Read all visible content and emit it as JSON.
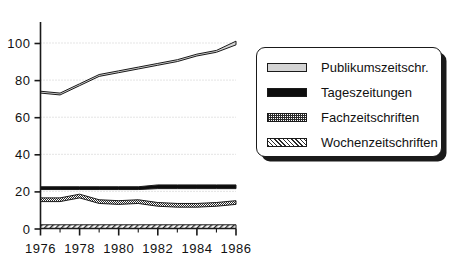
{
  "chart_data": {
    "type": "area",
    "title": "",
    "subtitle": "",
    "xlabel": "",
    "ylabel": "",
    "xlim": [
      1976,
      1986
    ],
    "ylim": [
      0,
      105
    ],
    "grid": true,
    "legend_position": "right",
    "x": [
      1976,
      1977,
      1978,
      1979,
      1980,
      1981,
      1982,
      1983,
      1984,
      1985,
      1986
    ],
    "xtick_labels": [
      "1976",
      "1978",
      "1980",
      "1982",
      "1984",
      "1986"
    ],
    "xtick_values": [
      1976,
      1978,
      1980,
      1982,
      1984,
      1986
    ],
    "ytick_labels": [
      "0",
      "20",
      "40",
      "60",
      "80",
      "100"
    ],
    "ytick_values": [
      0,
      20,
      40,
      60,
      80,
      100
    ],
    "series": [
      {
        "name": "Publikumszeitschr.",
        "pattern": "light-gray-band",
        "color": "#d4d4d4",
        "values": [
          74,
          73,
          78,
          83,
          85,
          87,
          89,
          91,
          94,
          96,
          101
        ],
        "values_lower": [
          73,
          72,
          77,
          82,
          84,
          86,
          88,
          90,
          93,
          95,
          99
        ]
      },
      {
        "name": "Tageszeitungen",
        "pattern": "solid-black-band",
        "color": "#0d0d0d",
        "values": [
          22.5,
          22.5,
          22.5,
          22.5,
          22.5,
          22.5,
          23.5,
          23.5,
          23.5,
          23.5,
          23.5
        ],
        "values_lower": [
          21,
          21,
          21,
          21,
          21,
          21,
          21.5,
          21.5,
          21.5,
          21.5,
          21.5
        ]
      },
      {
        "name": "Fachzeitschriften",
        "pattern": "checkered-band",
        "color": "#2b2b2b",
        "values": [
          16.5,
          16.5,
          18.5,
          15.5,
          15,
          15.5,
          14,
          13.5,
          13.5,
          14,
          15
        ],
        "values_lower": [
          14.5,
          14.5,
          16.5,
          13.5,
          13,
          13.5,
          12,
          11.5,
          11.5,
          12,
          13
        ]
      },
      {
        "name": "Wochenzeitschriften",
        "pattern": "diagonal-hatch-band",
        "color": "#2b2b2b",
        "values": [
          2,
          2,
          2,
          2,
          2,
          2,
          2,
          2,
          2,
          2,
          2
        ],
        "values_lower": [
          0,
          0,
          0,
          0,
          0,
          0,
          0,
          0,
          0,
          0,
          0
        ]
      }
    ]
  },
  "legend": {
    "items": [
      {
        "label": "Publikumszeitschr."
      },
      {
        "label": "Tageszeitungen"
      },
      {
        "label": "Fachzeitschriften"
      },
      {
        "label": "Wochenzeitschriften"
      }
    ]
  }
}
